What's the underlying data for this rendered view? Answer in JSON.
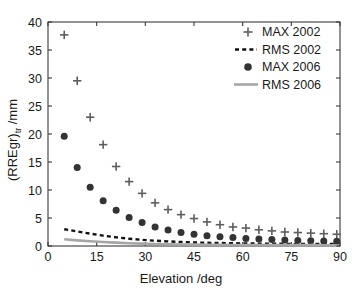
{
  "chart_data": {
    "type": "scatter",
    "title": "",
    "xlabel": "Elevation /deg",
    "ylabel": "(RREgr)",
    "ylabel_sub": "tr",
    "ylabel_unit": " /mm",
    "xlim": [
      0,
      90
    ],
    "ylim": [
      0,
      40
    ],
    "xticks": [
      0,
      15,
      30,
      45,
      60,
      75,
      90
    ],
    "yticks": [
      0,
      5,
      10,
      15,
      20,
      25,
      30,
      35,
      40
    ],
    "grid": false,
    "legend_position": "top-right",
    "x": [
      5,
      9,
      13,
      17,
      21,
      25,
      29,
      33,
      37,
      41,
      45,
      49,
      53,
      57,
      61,
      65,
      69,
      73,
      77,
      81,
      85,
      89
    ],
    "series": [
      {
        "name": "MAX 2002",
        "style": "plus",
        "color": "#5d5d5d",
        "values": [
          37.7,
          29.5,
          23.0,
          18.1,
          14.2,
          11.5,
          9.4,
          7.7,
          6.5,
          5.6,
          4.9,
          4.3,
          3.8,
          3.4,
          3.2,
          2.9,
          2.7,
          2.5,
          2.4,
          2.3,
          2.2,
          2.1
        ]
      },
      {
        "name": "RMS 2002",
        "style": "dashed-line",
        "color": "#111111",
        "values": [
          3.0,
          2.6,
          2.2,
          1.85,
          1.55,
          1.3,
          1.1,
          0.95,
          0.82,
          0.72,
          0.64,
          0.58,
          0.53,
          0.49,
          0.46,
          0.43,
          0.41,
          0.39,
          0.38,
          0.37,
          0.36,
          0.35
        ]
      },
      {
        "name": "MAX 2006",
        "style": "dot",
        "color": "#333333",
        "values": [
          19.6,
          14.0,
          10.5,
          8.1,
          6.4,
          5.1,
          4.2,
          3.4,
          2.85,
          2.4,
          2.1,
          1.85,
          1.65,
          1.5,
          1.35,
          1.25,
          1.15,
          1.05,
          1.0,
          0.95,
          0.9,
          0.85
        ]
      },
      {
        "name": "RMS 2006",
        "style": "solid-line",
        "color": "#a6a6a6",
        "values": [
          1.2,
          1.0,
          0.85,
          0.72,
          0.6,
          0.5,
          0.42,
          0.36,
          0.31,
          0.27,
          0.24,
          0.22,
          0.2,
          0.19,
          0.18,
          0.17,
          0.16,
          0.155,
          0.15,
          0.148,
          0.145,
          0.14
        ]
      }
    ]
  },
  "legend": {
    "items": [
      {
        "label": "MAX 2002",
        "style": "plus"
      },
      {
        "label": "RMS 2002",
        "style": "dashed-line"
      },
      {
        "label": "MAX 2006",
        "style": "dot"
      },
      {
        "label": "RMS 2006",
        "style": "solid-line"
      }
    ]
  }
}
